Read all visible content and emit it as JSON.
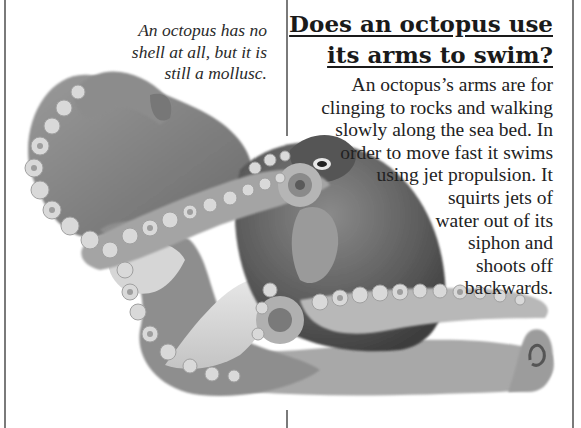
{
  "page": {
    "caption": {
      "lines": [
        "An octopus has no",
        "shell at all, but it is",
        "still a mollusc."
      ]
    },
    "heading": {
      "lines": [
        "Does an octopus use",
        "its arms to swim?"
      ]
    },
    "body": {
      "lines": [
        "An octopus’s arms are for",
        "clinging to rocks and walking",
        "slowly along the sea bed. In",
        "order to move fast it swims",
        "using jet propulsion. It",
        "squirts jets of",
        "water out of its",
        "siphon and",
        "shoots off",
        "backwards."
      ]
    },
    "image": {
      "subject": "octopus-photo",
      "colors": {
        "dark": "#4a4a4a",
        "mid": "#7d7d7d",
        "light": "#bdbdbd",
        "sucker": "#d8d8d8"
      }
    }
  }
}
